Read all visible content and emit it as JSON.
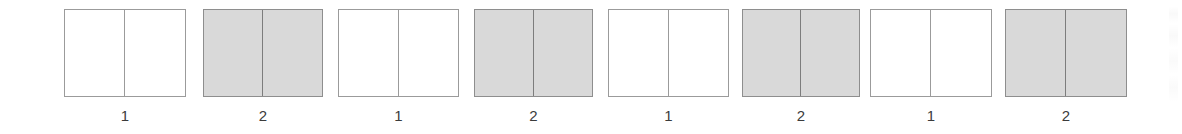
{
  "figure": {
    "background_color": "#ffffff",
    "width": 1182,
    "height": 134,
    "label_color": "#3b3b3b",
    "white_fill": "#ffffff",
    "white_border": "#9b9b9b",
    "gray_fill": "#d9d9d9",
    "gray_border": "#8e8e8e",
    "divider_color": "#7d7d7d"
  },
  "stimuli": [
    {
      "label": "1",
      "fill": "white",
      "left_px": 64,
      "width_px": 122
    },
    {
      "label": "2",
      "fill": "gray",
      "left_px": 203,
      "width_px": 120
    },
    {
      "label": "1",
      "fill": "white",
      "left_px": 338,
      "width_px": 121
    },
    {
      "label": "2",
      "fill": "gray",
      "left_px": 474,
      "width_px": 119
    },
    {
      "label": "1",
      "fill": "white",
      "left_px": 608,
      "width_px": 121
    },
    {
      "label": "2",
      "fill": "gray",
      "left_px": 742,
      "width_px": 118
    },
    {
      "label": "1",
      "fill": "white",
      "left_px": 870,
      "width_px": 122
    },
    {
      "label": "2",
      "fill": "gray",
      "left_px": 1005,
      "width_px": 122
    }
  ]
}
